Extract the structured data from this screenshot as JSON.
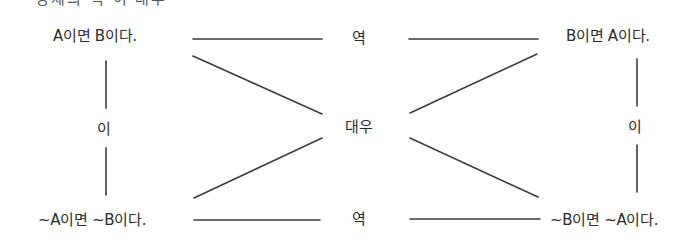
{
  "header": {
    "clipped_text": "명제의 역·이·대우"
  },
  "propositions": {
    "original": "A이면 B이다.",
    "converse": "B이면 A이다.",
    "inverse": "~A이면 ~B이다.",
    "contrapositive": "~B이면 ~A이다."
  },
  "relations": {
    "converse_top": "역",
    "converse_bottom": "역",
    "inverse_left": "이",
    "inverse_right": "이",
    "contrapositive_center": "대우"
  },
  "colors": {
    "line": "#3c3c3c",
    "text": "#2b2b2b",
    "background": "#ffffff"
  }
}
